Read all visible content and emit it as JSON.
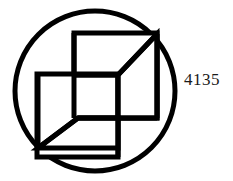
{
  "figure": {
    "label": "4135",
    "stroke_color": "#000000",
    "fill_color": "#ffffff",
    "background_color": "#ffffff",
    "label_color": "#1a1a1a",
    "circle": {
      "name": "outer-circle",
      "cx": 95,
      "cy": 91,
      "r": 80,
      "stroke_width": 5
    },
    "shapes": {
      "stroke_width": 5,
      "top_square": "74,33 157,33 157,118 74,118",
      "left_square": "37,74 118,74 118,157 37,157",
      "pinwheel_path_1": "157,33 118,74 118,157",
      "pinwheel_path_2": "37,148 78,118 157,118",
      "diagonal_upper": "74,75 118,75 157,34",
      "diagonal_lower": "38,148 78,118",
      "spoke_left": "38,148 38,74",
      "spoke_top": "157,34 157,118"
    }
  }
}
